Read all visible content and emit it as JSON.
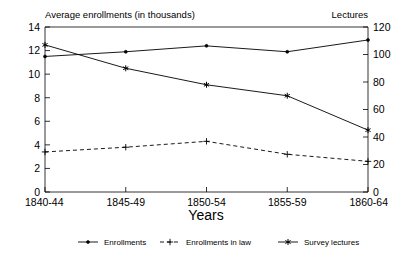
{
  "chart_data": {
    "type": "line",
    "title": "",
    "xlabel": "Years",
    "ylabel": "Average enrollments (in thousands)",
    "y2label": "Lectures",
    "categories": [
      "1840-44",
      "1845-49",
      "1850-54",
      "1855-59",
      "1860-64"
    ],
    "xlim": [
      0,
      4
    ],
    "ylim": [
      0,
      14
    ],
    "y2lim": [
      0,
      120
    ],
    "yticks": [
      "0",
      "2",
      "4",
      "6",
      "8",
      "10",
      "12",
      "14"
    ],
    "ytick_values": [
      0,
      2,
      4,
      6,
      8,
      10,
      12,
      14
    ],
    "y2ticks": [
      "0",
      "20",
      "40",
      "60",
      "80",
      "100",
      "120"
    ],
    "y2tick_values": [
      0,
      20,
      40,
      60,
      80,
      100,
      120
    ],
    "grid": false,
    "legend_position": "bottom",
    "series": [
      {
        "name": "Enrollments",
        "axis": "left",
        "marker": "dot",
        "linestyle": "solid",
        "color": "#000000",
        "values": [
          11.5,
          11.9,
          12.4,
          11.9,
          12.9
        ]
      },
      {
        "name": "Enrollments in law",
        "axis": "left",
        "marker": "plus",
        "linestyle": "dashed",
        "color": "#000000",
        "values": [
          3.4,
          3.8,
          4.3,
          3.2,
          2.6
        ]
      },
      {
        "name": "Survey lectures",
        "axis": "right",
        "marker": "star",
        "linestyle": "solid",
        "color": "#000000",
        "values": [
          107,
          90,
          78,
          70,
          45
        ]
      }
    ]
  },
  "labels": {
    "left_header": "Average enrollments (in thousands)",
    "right_header": "Lectures",
    "xaxis_title": "Years"
  },
  "legend": {
    "items": [
      {
        "label": "Enrollments"
      },
      {
        "label": "Enrollments in law"
      },
      {
        "label": "Survey lectures"
      }
    ]
  }
}
